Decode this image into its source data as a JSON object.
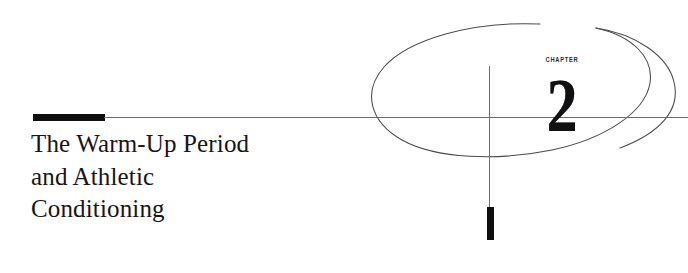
{
  "page": {
    "kind": "book-chapter-opener",
    "background_color": "#ffffff",
    "ink_color": "#111012",
    "rule_color": "#6d6c70"
  },
  "chapter": {
    "kicker": "CHAPTER",
    "number": "2"
  },
  "title": {
    "lines": [
      "The Warm-Up Period",
      "and Athletic",
      "Conditioning"
    ],
    "full_text": "The Warm-Up Period and Athletic Conditioning"
  },
  "decorations": {
    "rule_block_label": "thick-black-rule",
    "rule_thin_label": "thin-horizontal-rule",
    "crosshair_vertical_label": "vertical-crosshair-line",
    "tick_block_label": "thick-black-vertical-tick",
    "ellipse_label": "hand-drawn-open-ellipse",
    "ellipse_tail_label": "ellipse-open-tail-curve"
  }
}
